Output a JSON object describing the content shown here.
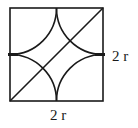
{
  "diagram": {
    "square": {
      "x": 10,
      "y": 8,
      "size": 93
    },
    "stroke_color": "#1a1a1a",
    "labels": {
      "right_side": "2 r",
      "bottom_side": "2 r"
    }
  }
}
